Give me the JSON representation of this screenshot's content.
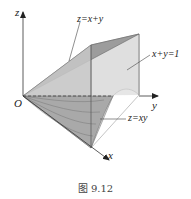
{
  "figure": {
    "caption": "图 9.12",
    "labels": {
      "z_axis": "z",
      "y_axis": "y",
      "x_axis": "x",
      "origin": "O",
      "plane_top": "z=x+y",
      "plane_side": "x+y=1",
      "surface_bottom": "z=xy"
    },
    "colors": {
      "dark_face": "#9a9a9a",
      "light_face": "#e4e4e4",
      "mid_face": "#bdbdbd",
      "bottom_surface": "#a8a8a8",
      "line": "#555555",
      "axis": "#333333"
    }
  }
}
